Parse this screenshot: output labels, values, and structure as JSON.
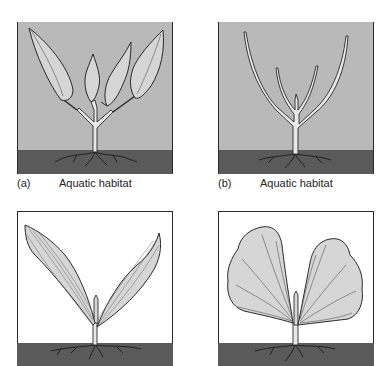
{
  "figure": {
    "panels": [
      {
        "id": "a",
        "label": "(a)",
        "caption": "Aquatic habitat",
        "habitat": "aquatic",
        "leaf_form": "broad lanceolate submerged leaves"
      },
      {
        "id": "b",
        "label": "(b)",
        "caption": "Aquatic habitat",
        "habitat": "aquatic",
        "leaf_form": "narrow linear submerged leaves"
      },
      {
        "id": "c",
        "label": "",
        "caption": "",
        "habitat": "terrestrial",
        "leaf_form": "elongated lanceolate leaves with parallel veins"
      },
      {
        "id": "d",
        "label": "",
        "caption": "",
        "habitat": "terrestrial",
        "leaf_form": "broad fan-shaped leaves"
      }
    ],
    "colors": {
      "water": "#b9b9b9",
      "soil": "#5a5a5a",
      "leaf_fill": "#d6d6d6",
      "outline": "#2a2a2a",
      "air": "#ffffff",
      "background": "#ffffff"
    }
  }
}
